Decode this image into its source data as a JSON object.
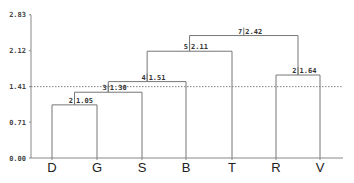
{
  "chart_data": {
    "type": "dendrogram",
    "title": "",
    "xlabel": "",
    "ylabel": "",
    "ylim": [
      0.0,
      2.83
    ],
    "y_ticks": [
      "0.00",
      "0.71",
      "1.41",
      "2.12",
      "2.83"
    ],
    "leaves": [
      "D",
      "G",
      "S",
      "B",
      "T",
      "R",
      "V"
    ],
    "cut_line": {
      "value": 1.41,
      "style": "dashed"
    },
    "merges": [
      {
        "id": "m1",
        "label_count": "2",
        "height": 1.05,
        "height_label": "1.05",
        "left": "D",
        "right": "G"
      },
      {
        "id": "m2",
        "label_count": "3",
        "height": 1.3,
        "height_label": "1.30",
        "left": "m1",
        "right": "S"
      },
      {
        "id": "m3",
        "label_count": "4",
        "height": 1.51,
        "height_label": "1.51",
        "left": "m2",
        "right": "B"
      },
      {
        "id": "m4",
        "label_count": "5",
        "height": 2.11,
        "height_label": "2.11",
        "left": "m3",
        "right": "T"
      },
      {
        "id": "m5",
        "label_count": "2",
        "height": 1.64,
        "height_label": "1.64",
        "left": "R",
        "right": "V"
      },
      {
        "id": "m6",
        "label_count": "7",
        "height": 2.42,
        "height_label": "2.42",
        "left": "m4",
        "right": "m5"
      }
    ]
  },
  "layout": {
    "axis_x": 31,
    "y0_px": 158,
    "px_per_unit": 50.6,
    "leaf_x": [
      52,
      97,
      142,
      186,
      232,
      276,
      320
    ],
    "x_end": 343
  }
}
